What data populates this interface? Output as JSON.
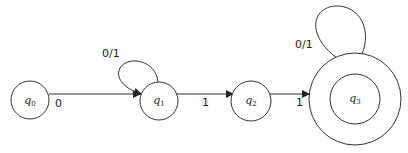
{
  "diagram": {
    "type": "finite-automaton",
    "states": [
      {
        "id": "q0",
        "name": "q",
        "sub": "0",
        "accepting": false
      },
      {
        "id": "q1",
        "name": "q",
        "sub": "1",
        "accepting": false
      },
      {
        "id": "q2",
        "name": "q",
        "sub": "2",
        "accepting": false
      },
      {
        "id": "q3",
        "name": "q",
        "sub": "3",
        "accepting": true
      }
    ],
    "transitions": [
      {
        "from": "q0",
        "to": "q1",
        "label": "0"
      },
      {
        "from": "q1",
        "to": "q1",
        "label": "0/1"
      },
      {
        "from": "q1",
        "to": "q2",
        "label": "1"
      },
      {
        "from": "q2",
        "to": "q3",
        "label": "1"
      },
      {
        "from": "q3",
        "to": "q3",
        "label": "0/1"
      }
    ]
  }
}
